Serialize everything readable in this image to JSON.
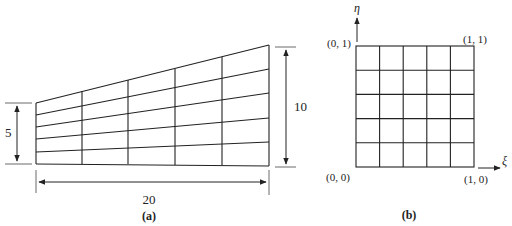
{
  "figure": {
    "panel_a": {
      "caption": "(a)",
      "left_height_label": "5",
      "right_height_label": "10",
      "width_label": "20",
      "description": "Trapezoidal physical domain meshed with 5x5 quadrilateral elements"
    },
    "panel_b": {
      "caption": "(b)",
      "axis_eta": "η",
      "axis_xi": "ξ",
      "corner_top_left": "(0, 1)",
      "corner_top_right": "(1, 1)",
      "corner_bottom_left": "(0, 0)",
      "corner_bottom_right": "(1, 0)",
      "description": "Unit square computational domain with 5x5 uniform grid"
    },
    "colors": {
      "line": "#222222",
      "background": "#ffffff"
    }
  }
}
